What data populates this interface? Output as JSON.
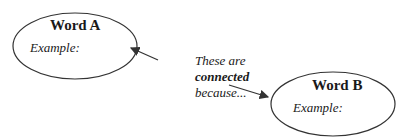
{
  "nodes": {
    "a": {
      "title": "Word A",
      "example_label": "Example:"
    },
    "b": {
      "title": "Word B",
      "example_label": "Example:"
    }
  },
  "connector": {
    "line1": "These are",
    "line2": "connected",
    "line3": "because..."
  }
}
